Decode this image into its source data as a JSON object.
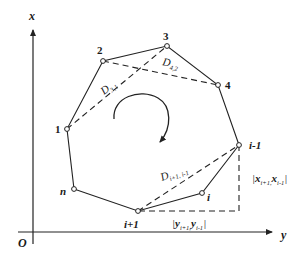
{
  "figure": {
    "axes": {
      "vertical_label": "x",
      "horizontal_label": "y",
      "origin_label": "O"
    },
    "vertices": [
      {
        "label": "1",
        "x": 67,
        "y": 129
      },
      {
        "label": "2",
        "x": 103,
        "y": 61
      },
      {
        "label": "3",
        "x": 167,
        "y": 46
      },
      {
        "label": "4",
        "x": 218,
        "y": 85
      },
      {
        "label": "i-1",
        "x": 239,
        "y": 145
      },
      {
        "label": "i",
        "x": 202,
        "y": 193
      },
      {
        "label": "i+1",
        "x": 138,
        "y": 211
      },
      {
        "label": "n",
        "x": 74,
        "y": 189
      }
    ],
    "diagonals": [
      {
        "main": "D",
        "sub": "3,1",
        "from": "1",
        "to": "3"
      },
      {
        "main": "D",
        "sub": "4,2",
        "from": "2",
        "to": "4"
      },
      {
        "main": "D",
        "sub": "i+1, i-1",
        "from": "i+1",
        "to": "i-1"
      }
    ],
    "distance_labels": {
      "x_diff": {
        "open": "|",
        "a": "x",
        "a_sub": "i+1,",
        "b": "x",
        "b_sub": "i-1",
        "close": "|"
      },
      "y_diff": {
        "open": "|",
        "a": "y",
        "a_sub": "i+1,",
        "b": "y",
        "b_sub": "i-1",
        "close": "|"
      }
    },
    "rotation_arrow": "clockwise"
  }
}
